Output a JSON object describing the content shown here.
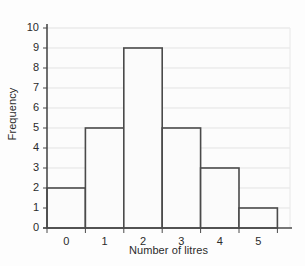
{
  "chart_data": {
    "type": "bar",
    "title": "",
    "subtitle": "",
    "xlabel": "Number of litres",
    "ylabel": "Frequency",
    "categories": [
      "0",
      "1",
      "2",
      "3",
      "4",
      "5"
    ],
    "values": [
      2,
      5,
      9,
      5,
      3,
      1
    ],
    "series": [
      {
        "name": "Frequency",
        "values": [
          2,
          5,
          9,
          5,
          3,
          1
        ]
      }
    ],
    "xtick_labels": [
      "0",
      "1",
      "2",
      "3",
      "4",
      "5"
    ],
    "ytick_labels": [
      "0",
      "1",
      "2",
      "3",
      "4",
      "5",
      "6",
      "7",
      "8",
      "9",
      "10"
    ],
    "ylim": [
      0,
      10
    ],
    "ytick_step": 1,
    "grid": "horizontal",
    "legend": "none",
    "bar_gap": 0,
    "colors": {
      "bar_fill": "#fbfbfb",
      "bar_edge": "#4a4a4a",
      "gridline": "#e3e3e3",
      "axis": "#4a4a4a",
      "text": "#2b2b2b",
      "background": "#fdfdfd",
      "plot_background": "#fcfcfc",
      "plot_border": "#eeeeee"
    }
  },
  "layout": {
    "plot_left": 47,
    "plot_right": 290,
    "plot_top": 28,
    "plot_bottom": 228,
    "bar_width": 38.4,
    "bars_start": 47
  }
}
